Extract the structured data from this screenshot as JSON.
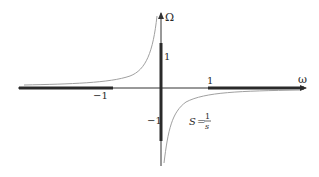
{
  "diagram": {
    "axes": {
      "x_label": "ω",
      "y_label": "Ω"
    },
    "ticks": {
      "x_pos": "1",
      "x_neg": "−1",
      "y_pos": "1",
      "y_neg": "−1"
    },
    "curve_label": {
      "lhs": "S",
      "eq": "=",
      "num": "1",
      "den": "s"
    },
    "colors": {
      "axis": "#333333",
      "thick_segment": "#2a2a2a",
      "curve": "#a0a0a0"
    }
  }
}
